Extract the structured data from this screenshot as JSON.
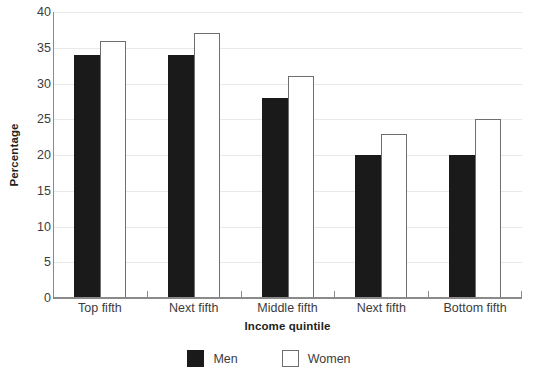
{
  "chart_data": {
    "type": "bar",
    "title": "",
    "subtitle": "",
    "xlabel": "Income quintile",
    "ylabel": "Percentage",
    "categories": [
      "Top fifth",
      "Next fifth",
      "Middle fifth",
      "Next fifth",
      "Bottom fifth"
    ],
    "series": [
      {
        "name": "Men",
        "color": "#1a1a1a",
        "values": [
          34,
          34,
          28,
          20,
          20
        ]
      },
      {
        "name": "Women",
        "color": "#ffffff",
        "values": [
          36,
          37,
          31,
          23,
          25
        ]
      }
    ],
    "ylim": [
      0,
      40
    ],
    "yticks": [
      0,
      5,
      10,
      15,
      20,
      25,
      30,
      35,
      40
    ],
    "ytick_labels": [
      "0",
      "5",
      "10",
      "15",
      "20",
      "25",
      "30",
      "35",
      "40"
    ],
    "grid": true,
    "grid_axis": "y",
    "legend_position": "bottom-center",
    "annotations": []
  },
  "legend": {
    "items": [
      {
        "label": "Men",
        "swatch": "filled-black-square"
      },
      {
        "label": "Women",
        "swatch": "outlined-white-square"
      }
    ]
  }
}
